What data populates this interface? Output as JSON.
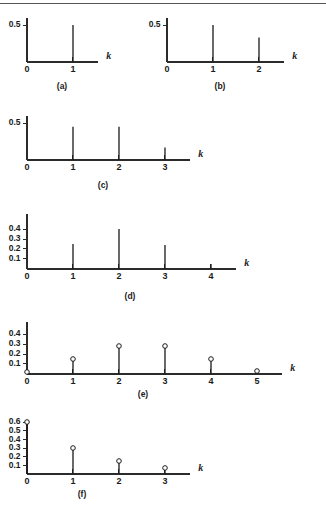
{
  "figure": {
    "background_color": "#ffffff",
    "line_color": "#1a1a1a",
    "rule_color": "#555555",
    "axis_variable": "k"
  },
  "chart_data": [
    {
      "id": "a",
      "type": "scatter",
      "title": "(a)",
      "caption": "(a)",
      "xlabel": "k",
      "ylabel": "",
      "x": [
        1
      ],
      "values": [
        0.5
      ],
      "xticks": [
        0,
        1
      ],
      "xtick_labels": [
        "0",
        "1"
      ],
      "yticks": [
        0.5
      ],
      "ytick_labels": [
        "0.5"
      ],
      "xlim": [
        0,
        1.55
      ],
      "ylim": [
        0,
        0.62
      ],
      "markers": false,
      "grid": false,
      "legend": false
    },
    {
      "id": "b",
      "type": "scatter",
      "title": "(b)",
      "caption": "(b)",
      "xlabel": "k",
      "ylabel": "",
      "x": [
        1,
        2
      ],
      "values": [
        0.5,
        0.33
      ],
      "xticks": [
        0,
        1,
        2
      ],
      "xtick_labels": [
        "0",
        "1",
        "2"
      ],
      "yticks": [
        0.5
      ],
      "ytick_labels": [
        "0.5"
      ],
      "xlim": [
        0,
        2.55
      ],
      "ylim": [
        0,
        0.62
      ],
      "markers": false,
      "grid": false,
      "legend": false
    },
    {
      "id": "c",
      "type": "scatter",
      "title": "(c)",
      "caption": "(c)",
      "xlabel": "k",
      "ylabel": "",
      "x": [
        1,
        2,
        3
      ],
      "values": [
        0.45,
        0.45,
        0.17
      ],
      "xticks": [
        0,
        1,
        2,
        3
      ],
      "xtick_labels": [
        "0",
        "1",
        "2",
        "3"
      ],
      "yticks": [
        0.5
      ],
      "ytick_labels": [
        "0.5"
      ],
      "xlim": [
        0,
        3.55
      ],
      "ylim": [
        0,
        0.62
      ],
      "markers": false,
      "grid": false,
      "legend": false
    },
    {
      "id": "d",
      "type": "scatter",
      "title": "(d)",
      "caption": "(d)",
      "xlabel": "k",
      "ylabel": "",
      "x": [
        1,
        2,
        3,
        4
      ],
      "values": [
        0.25,
        0.4,
        0.24,
        0.05
      ],
      "xticks": [
        0,
        1,
        2,
        3,
        4
      ],
      "xtick_labels": [
        "0",
        "1",
        "2",
        "3",
        "4"
      ],
      "yticks": [
        0.1,
        0.2,
        0.3,
        0.4
      ],
      "ytick_labels": [
        "0.1",
        "0.2",
        "0.3",
        "0.4"
      ],
      "xlim": [
        0,
        4.55
      ],
      "ylim": [
        0,
        0.55
      ],
      "markers": false,
      "grid": false,
      "legend": false
    },
    {
      "id": "e",
      "type": "scatter",
      "title": "(e)",
      "caption": "(e)",
      "xlabel": "k",
      "ylabel": "",
      "x": [
        0,
        1,
        2,
        3,
        4,
        5
      ],
      "values": [
        0.02,
        0.15,
        0.28,
        0.28,
        0.15,
        0.03
      ],
      "xticks": [
        0,
        1,
        2,
        3,
        4,
        5
      ],
      "xtick_labels": [
        "0",
        "1",
        "2",
        "3",
        "4",
        "5"
      ],
      "yticks": [
        0.1,
        0.2,
        0.3,
        0.4
      ],
      "ytick_labels": [
        "0.1",
        "0.2",
        "0.3",
        "0.4"
      ],
      "xlim": [
        0,
        5.55
      ],
      "ylim": [
        0,
        0.5
      ],
      "markers": true,
      "grid": false,
      "legend": false
    },
    {
      "id": "f",
      "type": "scatter",
      "title": "(f)",
      "caption": "(f)",
      "xlabel": "k",
      "ylabel": "",
      "x": [
        0,
        1,
        2,
        3
      ],
      "values": [
        0.6,
        0.3,
        0.15,
        0.07
      ],
      "xticks": [
        0,
        1,
        2,
        3
      ],
      "xtick_labels": [
        "0",
        "1",
        "2",
        "3"
      ],
      "yticks": [
        0.1,
        0.2,
        0.3,
        0.4,
        0.5,
        0.6
      ],
      "ytick_labels": [
        "0.1",
        "0.2",
        "0.3",
        "0.4",
        "0.5",
        "0.6"
      ],
      "xlim": [
        0,
        3.55
      ],
      "ylim": [
        0,
        0.68
      ],
      "markers": true,
      "grid": false,
      "legend": false
    }
  ]
}
